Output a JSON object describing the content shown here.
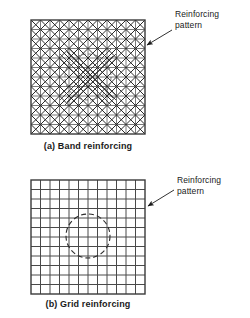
{
  "figure": {
    "colors": {
      "line": "#3a3a3a",
      "grid": "#4a4a4a",
      "diagonal": "#2b2b2b",
      "background": "#ffffff",
      "text": "#1a1a1a"
    }
  },
  "panels": [
    {
      "id": "a",
      "caption": "(a) Band reinforcing",
      "callout_label": "Reinforcing\npattern",
      "callout_line1": "Reinforcing",
      "callout_line2": "pattern",
      "pattern_type": "band",
      "square": {
        "x": 31,
        "y": 20,
        "size": 114
      },
      "grid_divisions": 12,
      "hole": {
        "cx": 88,
        "cy": 77,
        "r": 23
      },
      "band_description": "Diagonal reinforcing bands in both directions, concentrated densely around the central circular hole"
    },
    {
      "id": "b",
      "caption": "(b) Grid reinforcing",
      "callout_label": "Reinforcing\npattern",
      "callout_line1": "Reinforcing",
      "callout_line2": "pattern",
      "pattern_type": "grid",
      "square": {
        "x": 31,
        "y": 180,
        "size": 114
      },
      "grid_divisions": 12,
      "hole": {
        "cx": 88,
        "cy": 236,
        "r": 22
      },
      "band_description": "Uniform orthogonal grid of reinforcing members with a central circular hole shown dashed"
    }
  ],
  "arrows": [
    {
      "panel": "a",
      "from_x": 172,
      "from_y": 30,
      "to_x": 146,
      "to_y": 45
    },
    {
      "panel": "b",
      "from_x": 174,
      "from_y": 190,
      "to_x": 147,
      "to_y": 205
    }
  ]
}
